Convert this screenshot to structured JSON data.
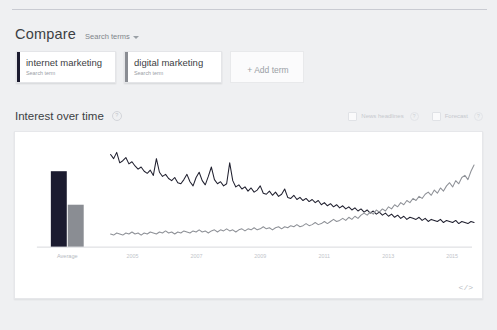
{
  "page": {
    "background": "#eff0f2"
  },
  "compare": {
    "title": "Compare",
    "dropdown_label": "Search terms",
    "terms": [
      {
        "name": "internet marketing",
        "subtitle": "Search term",
        "color": "#1b1b2f"
      },
      {
        "name": "digital marketing",
        "subtitle": "Search term",
        "color": "#8a8d93"
      }
    ],
    "add_term_label": "+ Add term"
  },
  "interest_over_time": {
    "title": "Interest over time",
    "info_icon": "question-mark-icon",
    "toggles": [
      {
        "label": "News headlines",
        "checked": false
      },
      {
        "label": "Forecast",
        "checked": false
      }
    ],
    "embed_icon": "</>"
  },
  "chart_data": {
    "type": "line",
    "title": "Interest over time",
    "xlabel": "",
    "ylabel": "",
    "ylim": [
      0,
      100
    ],
    "grid": false,
    "legend_position": "none",
    "average_bars": {
      "type": "bar",
      "axis_label": "Average",
      "categories": [
        "internet marketing",
        "digital marketing"
      ],
      "values": [
        72,
        40
      ],
      "colors": [
        "#1b1b2f",
        "#8a8d93"
      ]
    },
    "xticks": [
      "2005",
      "2007",
      "2009",
      "2011",
      "2013",
      "2015"
    ],
    "series": [
      {
        "name": "internet marketing",
        "color": "#20202f",
        "values": [
          88,
          84,
          90,
          80,
          82,
          85,
          79,
          81,
          77,
          74,
          76,
          72,
          70,
          73,
          68,
          84,
          71,
          67,
          69,
          65,
          63,
          66,
          61,
          60,
          64,
          69,
          62,
          58,
          66,
          71,
          63,
          59,
          67,
          76,
          64,
          60,
          62,
          58,
          60,
          80,
          63,
          57,
          59,
          55,
          57,
          53,
          56,
          52,
          54,
          58,
          51,
          50,
          53,
          49,
          52,
          48,
          50,
          55,
          47,
          46,
          49,
          45,
          47,
          44,
          46,
          43,
          45,
          42,
          44,
          40,
          42,
          39,
          41,
          38,
          40,
          37,
          39,
          36,
          38,
          35,
          37,
          34,
          36,
          33,
          35,
          32,
          34,
          31,
          33,
          30,
          32,
          29,
          31,
          28,
          30,
          27,
          29,
          26,
          28,
          27,
          26,
          28,
          25,
          27,
          24,
          26,
          25,
          24,
          26,
          23,
          25,
          24,
          23,
          25,
          22,
          24,
          23,
          22,
          24,
          23
        ]
      },
      {
        "name": "digital marketing",
        "color": "#8e9197",
        "values": [
          12,
          11,
          13,
          12,
          11,
          13,
          12,
          14,
          12,
          13,
          11,
          13,
          12,
          14,
          13,
          12,
          14,
          13,
          15,
          13,
          14,
          12,
          14,
          13,
          15,
          14,
          13,
          15,
          14,
          16,
          14,
          15,
          13,
          15,
          16,
          14,
          16,
          15,
          17,
          15,
          16,
          14,
          16,
          17,
          15,
          17,
          16,
          18,
          16,
          17,
          19,
          17,
          18,
          16,
          18,
          19,
          17,
          19,
          18,
          20,
          19,
          21,
          19,
          20,
          22,
          20,
          21,
          23,
          21,
          22,
          24,
          22,
          24,
          26,
          24,
          25,
          27,
          25,
          28,
          26,
          29,
          27,
          30,
          32,
          30,
          33,
          31,
          35,
          33,
          36,
          34,
          38,
          36,
          40,
          38,
          42,
          40,
          44,
          42,
          46,
          44,
          48,
          46,
          50,
          52,
          49,
          54,
          51,
          56,
          53,
          58,
          61,
          57,
          63,
          60,
          66,
          68,
          64,
          72,
          78
        ]
      }
    ]
  }
}
